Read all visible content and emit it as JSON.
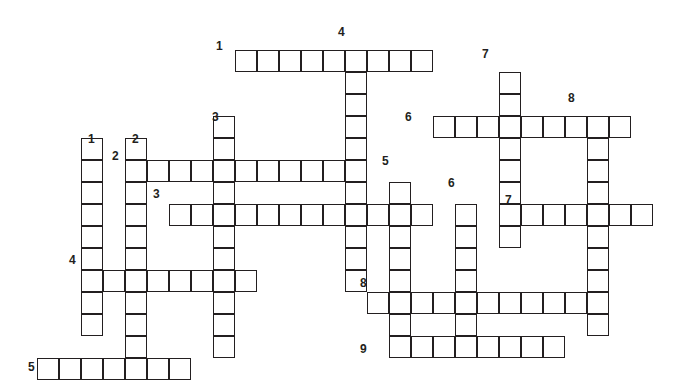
{
  "puzzle": {
    "title": "Crossword Puzzle Grid",
    "type": "crossword-grid",
    "width": 675,
    "height": 381,
    "cell_size": 22,
    "origin_x": 37,
    "origin_y": 28,
    "grid_columns": 29,
    "grid_rows": 16,
    "ink_color": "#231f20",
    "cell_fill": "#ffffff",
    "background": "#ffffff",
    "entries": [
      {
        "number": "1",
        "direction": "across",
        "row": 1,
        "col": 9,
        "length": 9,
        "label": "1"
      },
      {
        "number": "2",
        "direction": "across",
        "row": 6,
        "col": 4,
        "length": 11,
        "label": "2"
      },
      {
        "number": "3",
        "direction": "across",
        "row": 8,
        "col": 6,
        "length": 12,
        "label": "3"
      },
      {
        "number": "4",
        "direction": "across",
        "row": 11,
        "col": 2,
        "length": 8,
        "label": "4"
      },
      {
        "number": "5",
        "direction": "across",
        "row": 15,
        "col": 0,
        "length": 7,
        "label": "5"
      },
      {
        "number": "6",
        "direction": "across",
        "row": 4,
        "col": 18,
        "length": 9,
        "label": "6"
      },
      {
        "number": "7",
        "direction": "across",
        "row": 8,
        "col": 22,
        "length": 6,
        "label": "7"
      },
      {
        "number": "8",
        "direction": "across",
        "row": 12,
        "col": 15,
        "length": 10,
        "label": "8"
      },
      {
        "number": "9",
        "direction": "across",
        "row": 14,
        "col": 16,
        "length": 8,
        "label": "9"
      },
      {
        "number": "1",
        "direction": "down",
        "row": 5,
        "col": 2,
        "length": 9,
        "label": "1"
      },
      {
        "number": "2",
        "direction": "down",
        "row": 5,
        "col": 4,
        "length": 11,
        "label": "2"
      },
      {
        "number": "3",
        "direction": "down",
        "row": 4,
        "col": 8,
        "length": 11,
        "label": "3"
      },
      {
        "number": "4",
        "direction": "down",
        "row": 1,
        "col": 14,
        "length": 11,
        "label": "4"
      },
      {
        "number": "5",
        "direction": "down",
        "row": 7,
        "col": 16,
        "length": 8,
        "label": "5"
      },
      {
        "number": "6",
        "direction": "down",
        "row": 8,
        "col": 19,
        "length": 6,
        "label": "6"
      },
      {
        "number": "7",
        "direction": "down",
        "row": 2,
        "col": 21,
        "length": 8,
        "label": "7"
      },
      {
        "number": "8",
        "direction": "down",
        "row": 4,
        "col": 25,
        "length": 10,
        "label": "8"
      }
    ],
    "number_labels": [
      {
        "text": "1",
        "x": 216,
        "y": 40,
        "name": "clue-number-1-across"
      },
      {
        "text": "2",
        "x": 112,
        "y": 150,
        "name": "clue-number-2-across"
      },
      {
        "text": "3",
        "x": 153,
        "y": 188,
        "name": "clue-number-3-across"
      },
      {
        "text": "4",
        "x": 69,
        "y": 254,
        "name": "clue-number-4-across"
      },
      {
        "text": "5",
        "x": 28,
        "y": 361,
        "name": "clue-number-5-across"
      },
      {
        "text": "6",
        "x": 405,
        "y": 111,
        "name": "clue-number-6-across"
      },
      {
        "text": "7",
        "x": 505,
        "y": 194,
        "name": "clue-number-7-across"
      },
      {
        "text": "8",
        "x": 360,
        "y": 277,
        "name": "clue-number-8-across"
      },
      {
        "text": "9",
        "x": 360,
        "y": 343,
        "name": "clue-number-9-across"
      },
      {
        "text": "1",
        "x": 88,
        "y": 133,
        "name": "clue-number-1-down"
      },
      {
        "text": "2",
        "x": 132,
        "y": 133,
        "name": "clue-number-2-down"
      },
      {
        "text": "3",
        "x": 212,
        "y": 111,
        "name": "clue-number-3-down"
      },
      {
        "text": "4",
        "x": 338,
        "y": 26,
        "name": "clue-number-4-down"
      },
      {
        "text": "5",
        "x": 382,
        "y": 155,
        "name": "clue-number-5-down"
      },
      {
        "text": "6",
        "x": 448,
        "y": 177,
        "name": "clue-number-6-down"
      },
      {
        "text": "7",
        "x": 482,
        "y": 48,
        "name": "clue-number-7-down"
      },
      {
        "text": "8",
        "x": 568,
        "y": 92,
        "name": "clue-number-8-down"
      }
    ]
  }
}
